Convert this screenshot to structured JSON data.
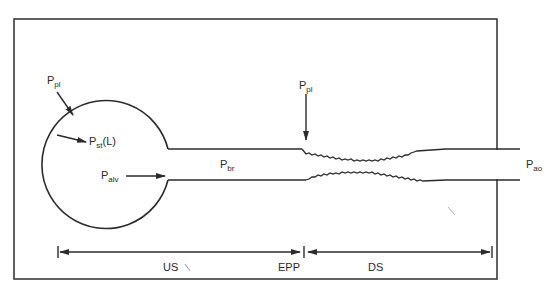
{
  "diagram": {
    "title": "",
    "labels": {
      "ppl_left": {
        "main": "P",
        "sub": "pl"
      },
      "pst": {
        "main": "P",
        "sub": "st",
        "suffix": "(L)"
      },
      "palv": {
        "main": "P",
        "sub": "alv"
      },
      "pbr": {
        "main": "P",
        "sub": "br"
      },
      "ppl_right": {
        "main": "P",
        "sub": "pl"
      },
      "pao": {
        "main": "P",
        "sub": "ao"
      }
    },
    "segments": {
      "us": "US",
      "epp": "EPP",
      "ds": "DS"
    },
    "colors": {
      "line": "#2b2b2b",
      "frame": "#3a3a3a",
      "background": "#ffffff"
    }
  }
}
